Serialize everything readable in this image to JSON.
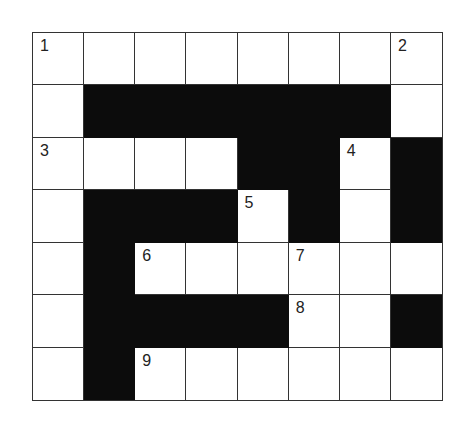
{
  "puzzle": {
    "rows": 7,
    "cols": 8,
    "layout": [
      "WWWWWWWW",
      "WBBBBBBW",
      "WWWWBBWB",
      "WBBBWBWB",
      "WBWWWWWW",
      "WBBBBWWB",
      "WBWWWWWW"
    ],
    "numbers": [
      {
        "r": 0,
        "c": 0,
        "n": "1"
      },
      {
        "r": 0,
        "c": 7,
        "n": "2"
      },
      {
        "r": 2,
        "c": 0,
        "n": "3"
      },
      {
        "r": 2,
        "c": 6,
        "n": "4"
      },
      {
        "r": 3,
        "c": 4,
        "n": "5"
      },
      {
        "r": 4,
        "c": 2,
        "n": "6"
      },
      {
        "r": 4,
        "c": 5,
        "n": "7"
      },
      {
        "r": 5,
        "c": 5,
        "n": "8"
      },
      {
        "r": 6,
        "c": 2,
        "n": "9"
      }
    ],
    "colors": {
      "block": "#0c0c0c",
      "cell": "#ffffff",
      "line": "#333333"
    }
  }
}
